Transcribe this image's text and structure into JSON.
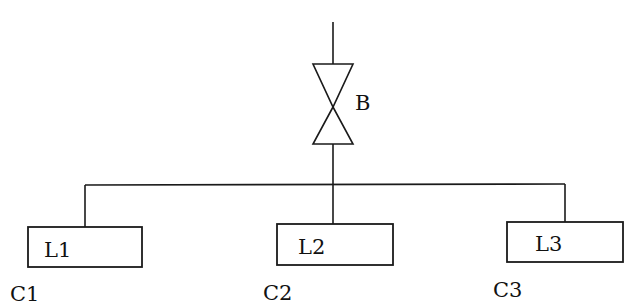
{
  "diagram": {
    "type": "piping-schematic",
    "colors": {
      "line": "#1a1a1a",
      "background": "#ffffff",
      "text": "#111111"
    },
    "valve": {
      "label": "B",
      "icon": "gate-valve-icon"
    },
    "branches": [
      {
        "box_label": "L1",
        "caption": "C1"
      },
      {
        "box_label": "L2",
        "caption": "C2"
      },
      {
        "box_label": "L3",
        "caption": "C3"
      }
    ]
  }
}
